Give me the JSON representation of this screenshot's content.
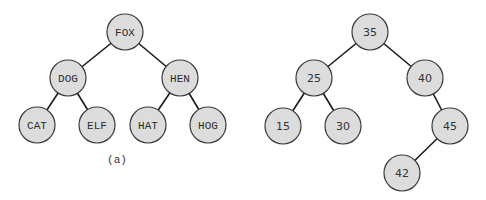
{
  "style": {
    "node_fill": "#dcdcdc",
    "node_stroke": "#3a3a3a",
    "edge_color": "#1a1a1a",
    "node_radius": 18
  },
  "trees": [
    {
      "name": "string-bst",
      "caption": "(a)",
      "caption_pos": [
        117,
        163
      ],
      "label_font": "mono",
      "nodes": [
        {
          "id": "FOX",
          "label": "FOX",
          "x": 125,
          "y": 32
        },
        {
          "id": "DOG",
          "label": "DOG",
          "x": 68,
          "y": 78
        },
        {
          "id": "HEN",
          "label": "HEN",
          "x": 180,
          "y": 78
        },
        {
          "id": "CAT",
          "label": "CAT",
          "x": 37,
          "y": 125
        },
        {
          "id": "ELF",
          "label": "ELF",
          "x": 97,
          "y": 125
        },
        {
          "id": "HAT",
          "label": "HAT",
          "x": 148,
          "y": 125
        },
        {
          "id": "HOG",
          "label": "HOG",
          "x": 208,
          "y": 125
        }
      ],
      "edges": [
        [
          "FOX",
          "DOG"
        ],
        [
          "FOX",
          "HEN"
        ],
        [
          "DOG",
          "CAT"
        ],
        [
          "DOG",
          "ELF"
        ],
        [
          "HEN",
          "HAT"
        ],
        [
          "HEN",
          "HOG"
        ]
      ]
    },
    {
      "name": "number-bst",
      "caption": "",
      "label_font": "sans",
      "nodes": [
        {
          "id": "35",
          "label": "35",
          "x": 370,
          "y": 32
        },
        {
          "id": "25",
          "label": "25",
          "x": 314,
          "y": 78
        },
        {
          "id": "40",
          "label": "40",
          "x": 425,
          "y": 78
        },
        {
          "id": "15",
          "label": "15",
          "x": 283,
          "y": 126
        },
        {
          "id": "30",
          "label": "30",
          "x": 343,
          "y": 126
        },
        {
          "id": "45",
          "label": "45",
          "x": 450,
          "y": 126
        },
        {
          "id": "42",
          "label": "42",
          "x": 402,
          "y": 173
        }
      ],
      "edges": [
        [
          "35",
          "25"
        ],
        [
          "35",
          "40"
        ],
        [
          "25",
          "15"
        ],
        [
          "25",
          "30"
        ],
        [
          "40",
          "45"
        ],
        [
          "45",
          "42"
        ]
      ]
    }
  ]
}
